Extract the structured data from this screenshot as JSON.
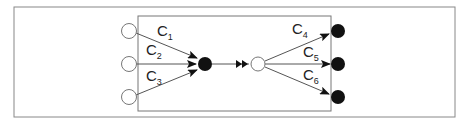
{
  "diagram": {
    "type": "control-flow / merge-split",
    "outer_frame": {
      "x": 14,
      "y": 7,
      "w": 441,
      "h": 110
    },
    "inner_frame": {
      "x": 138,
      "y": 16,
      "w": 193,
      "h": 95
    },
    "colors": {
      "frame": "#888888",
      "line": "#555555",
      "fill_dark": "#111111",
      "fill_light": "#ffffff"
    },
    "inputs": [
      {
        "id": "in1",
        "x": 129,
        "y": 31,
        "fill": "white"
      },
      {
        "id": "in2",
        "x": 129,
        "y": 64,
        "fill": "white"
      },
      {
        "id": "in3",
        "x": 129,
        "y": 97,
        "fill": "white"
      }
    ],
    "merge_node": {
      "x": 205,
      "y": 64,
      "fill": "black"
    },
    "split_node": {
      "x": 258,
      "y": 64,
      "fill": "white"
    },
    "outputs": [
      {
        "id": "out4",
        "x": 338,
        "y": 31,
        "fill": "black"
      },
      {
        "id": "out5",
        "x": 338,
        "y": 64,
        "fill": "black"
      },
      {
        "id": "out6",
        "x": 338,
        "y": 97,
        "fill": "black"
      }
    ],
    "edges": [
      {
        "label": "C",
        "sub": "1",
        "from": "in1",
        "to": "merge"
      },
      {
        "label": "C",
        "sub": "2",
        "from": "in2",
        "to": "merge"
      },
      {
        "label": "C",
        "sub": "3",
        "from": "in3",
        "to": "merge"
      },
      {
        "label": "C",
        "sub": "4",
        "from": "split",
        "to": "out4"
      },
      {
        "label": "C",
        "sub": "5",
        "from": "split",
        "to": "out5"
      },
      {
        "label": "C",
        "sub": "6",
        "from": "split",
        "to": "out6"
      }
    ],
    "link": {
      "from": "merge",
      "to": "split",
      "arrow": "double"
    }
  }
}
